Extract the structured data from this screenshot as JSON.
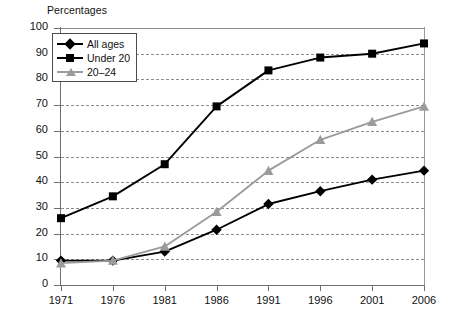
{
  "chart_data": {
    "type": "line",
    "title": "Percentages",
    "xlabel": "",
    "ylabel": "",
    "ylim": [
      0,
      100
    ],
    "ytick_step": 10,
    "grid": "horizontal-dashed",
    "legend_position": "top-left-inside",
    "categories": [
      "1971",
      "1976",
      "1981",
      "1986",
      "1991",
      "1996",
      "2001",
      "2006"
    ],
    "yticks": [
      "0",
      "10",
      "20",
      "30",
      "40",
      "50",
      "60",
      "70",
      "80",
      "90",
      "100"
    ],
    "series": [
      {
        "name": "All ages",
        "marker": "diamond",
        "color": "#000000",
        "values": [
          9.5,
          9.5,
          13,
          21.5,
          31.5,
          36.5,
          41,
          44.5
        ]
      },
      {
        "name": "Under 20",
        "marker": "square",
        "color": "#000000",
        "values": [
          26,
          34.5,
          47,
          69.5,
          83.5,
          88.5,
          90,
          94
        ]
      },
      {
        "name": "20–24",
        "marker": "triangle",
        "color": "#9b9b9b",
        "values": [
          8.5,
          9.5,
          15,
          28.5,
          44.5,
          56.5,
          63.5,
          69.5
        ]
      }
    ]
  },
  "colors": {
    "axis": "#6f6f6f",
    "grid": "#8d8d8d",
    "series_black": "#000000",
    "series_gray": "#9b9b9b",
    "background": "#ffffff"
  }
}
